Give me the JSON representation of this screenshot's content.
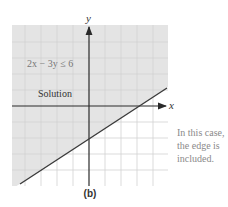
{
  "figure": {
    "caption": "(b)",
    "axes": {
      "x_label": "x",
      "y_label": "y"
    },
    "inequality_label": "2x − 3y ≤ 6",
    "region_label": "Solution",
    "note_lines": [
      "In this case,",
      "the edge is",
      "included."
    ],
    "colors": {
      "shaded_region": "#e4e4e4",
      "grid_line": "#d2d2d2",
      "axis": "#2a2a2a",
      "boundary_line": "#3a3a3a",
      "note_text": "#8a8a8a"
    },
    "grid": {
      "x_range": [
        -5,
        5
      ],
      "y_range": [
        -5,
        5
      ],
      "unit": 1
    },
    "boundary": {
      "equation": "2x - 3y = 6",
      "x_intercept": 3,
      "y_intercept": -2,
      "style": "solid",
      "included": true
    },
    "shaded_side": "above-left"
  }
}
